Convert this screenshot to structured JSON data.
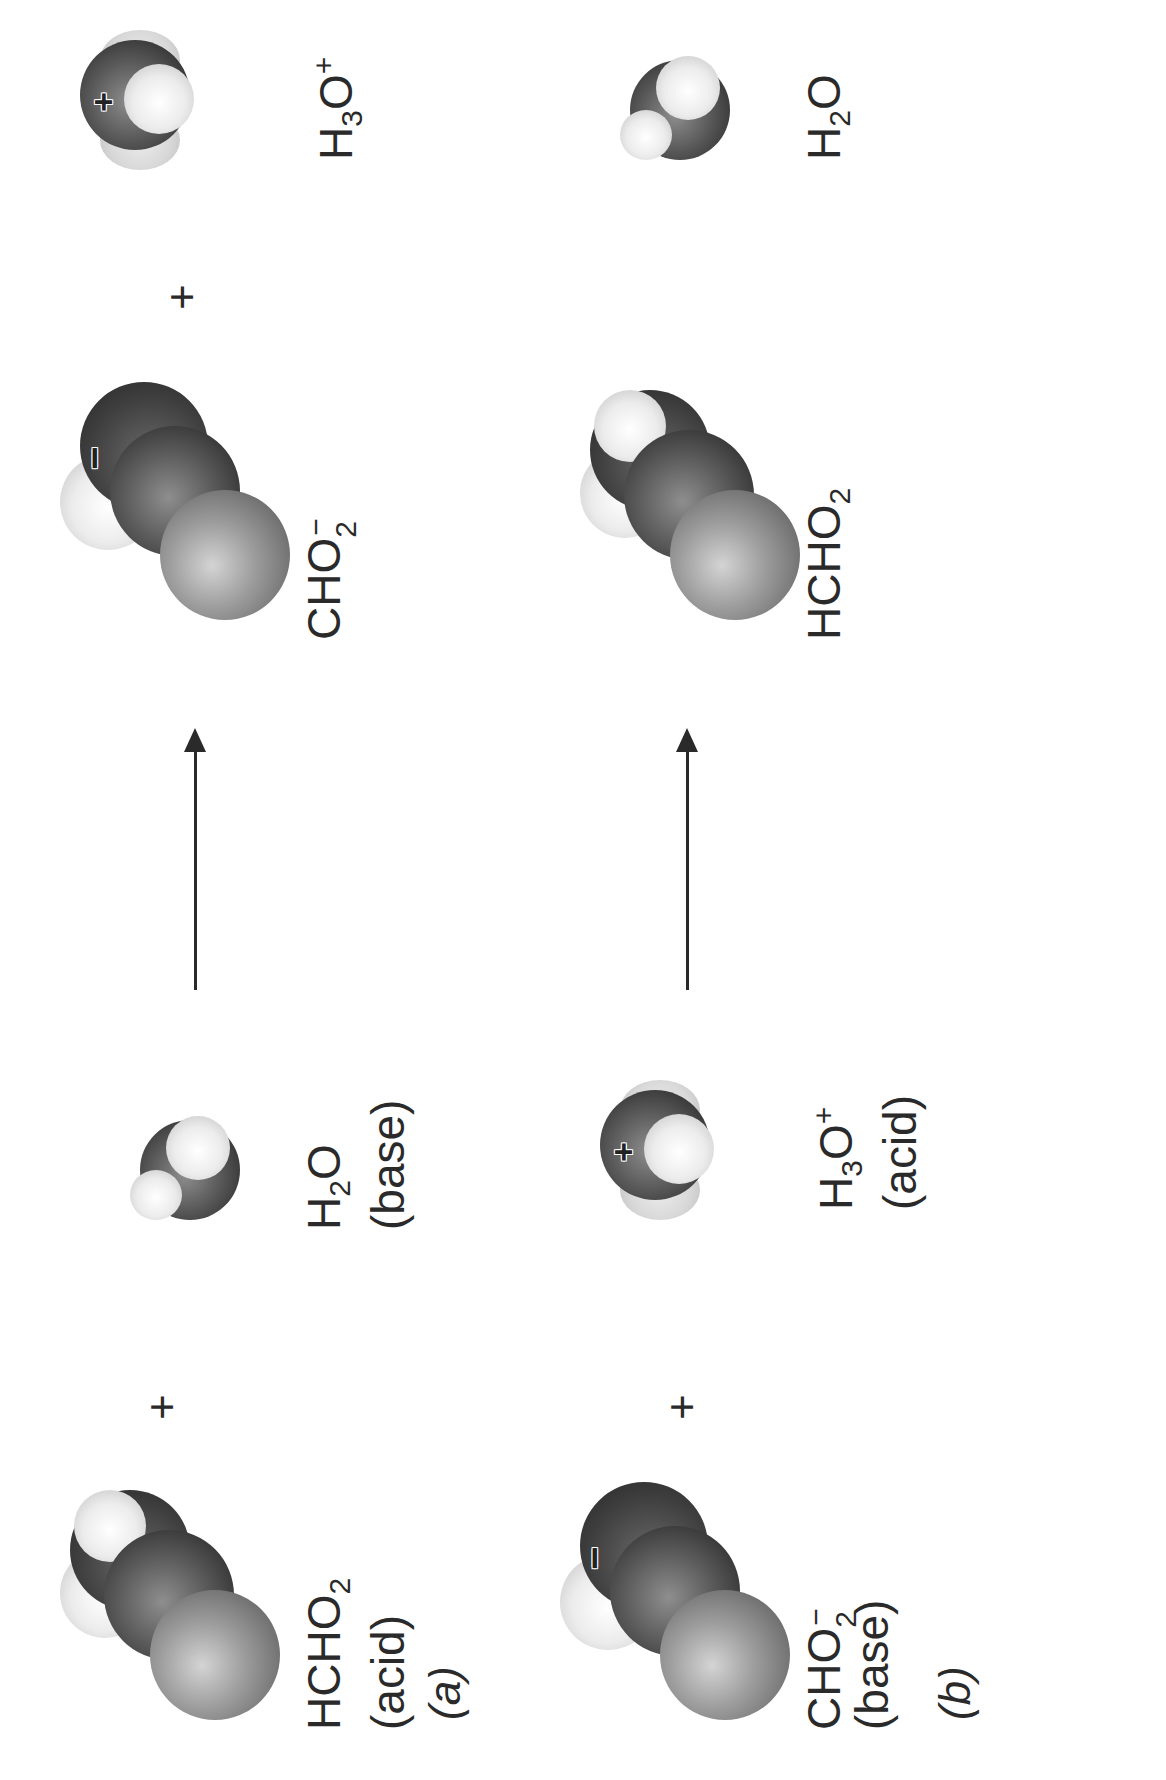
{
  "figure": {
    "orientation": "rotated 90 degrees counter-clockwise",
    "rows": [
      {
        "part": "(a)",
        "part_letter": "a",
        "reactants": [
          {
            "formula": "HCHO2",
            "display_main": "HCHO",
            "sub": "2",
            "sup": "",
            "role": "(acid)",
            "charge_marker": ""
          },
          {
            "formula": "H2O",
            "display_main_1": "H",
            "sub": "2",
            "display_main_2": "O",
            "sup": "",
            "role": "(base)",
            "charge_marker": ""
          }
        ],
        "plus_reactants": "+",
        "arrow": "→",
        "products": [
          {
            "formula": "CHO2-",
            "display_main": "CHO",
            "sub": "2",
            "sup": "−",
            "role": "",
            "charge_marker": "−"
          },
          {
            "formula": "H3O+",
            "display_main_1": "H",
            "sub": "3",
            "display_main_2": "O",
            "sup": "+",
            "role": "",
            "charge_marker": "+"
          }
        ],
        "plus_products": "+"
      },
      {
        "part": "(b)",
        "part_letter": "b",
        "reactants": [
          {
            "formula": "CHO2-",
            "display_main": "CHO",
            "sub": "2",
            "sup": "−",
            "role": "(base)",
            "charge_marker": "−"
          },
          {
            "formula": "H3O+",
            "display_main_1": "H",
            "sub": "3",
            "display_main_2": "O",
            "sup": "+",
            "role": "(acid)",
            "charge_marker": "+"
          }
        ],
        "plus_reactants": "+",
        "arrow": "→",
        "products": [
          {
            "formula": "HCHO2",
            "display_main": "HCHO",
            "sub": "2",
            "sup": "",
            "role": "",
            "charge_marker": ""
          },
          {
            "formula": "H2O",
            "display_main_1": "H",
            "sub": "2",
            "display_main_2": "O",
            "sup": "",
            "role": "",
            "charge_marker": ""
          }
        ],
        "plus_products": "+"
      }
    ],
    "colors": {
      "background": "#ffffff",
      "text": "#2a2a2a",
      "oxygen_atom": "#3a3a3a",
      "carbon_atom": "#8a8a8a",
      "hydrogen_atom": "#e8e8e8"
    }
  }
}
